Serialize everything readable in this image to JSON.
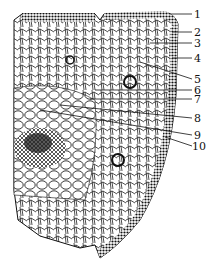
{
  "figure": {
    "labels": [
      {
        "id": "1",
        "text": "1",
        "y": 14
      },
      {
        "id": "2",
        "text": "2",
        "y": 32
      },
      {
        "id": "3",
        "text": "3",
        "y": 43
      },
      {
        "id": "4",
        "text": "4",
        "y": 58
      },
      {
        "id": "5",
        "text": "5",
        "y": 79
      },
      {
        "id": "6",
        "text": "6",
        "y": 90
      },
      {
        "id": "7",
        "text": "7",
        "y": 99
      },
      {
        "id": "8",
        "text": "8",
        "y": 118
      },
      {
        "id": "9",
        "text": "9",
        "y": 135
      },
      {
        "id": "10",
        "text": "10",
        "y": 146
      }
    ],
    "colors": {
      "ink": "#111111",
      "background": "#ffffff"
    }
  }
}
